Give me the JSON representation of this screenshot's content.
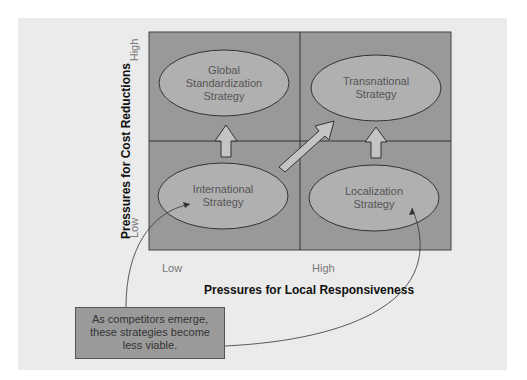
{
  "diagram": {
    "y_axis": {
      "title": "Pressures for Cost Reductions",
      "high": "High",
      "low": "Low"
    },
    "x_axis": {
      "title": "Pressures for Local Responsiveness",
      "low": "Low",
      "high": "High"
    },
    "quadrants": {
      "top_left": [
        "Global",
        "Standardization",
        "Strategy"
      ],
      "top_right": [
        "Transnational",
        "Strategy"
      ],
      "bottom_left": [
        "International",
        "Strategy"
      ],
      "bottom_right": [
        "Localization",
        "Strategy"
      ]
    },
    "note": [
      "As competitors emerge,",
      "these strategies become",
      "less viable."
    ],
    "colors": {
      "grid_fill": "#999999",
      "ellipse_fill": "#b0b0b0",
      "arrow_fill": "#c4c4c4",
      "panel": "#ebebeb",
      "stroke": "#333333"
    }
  }
}
